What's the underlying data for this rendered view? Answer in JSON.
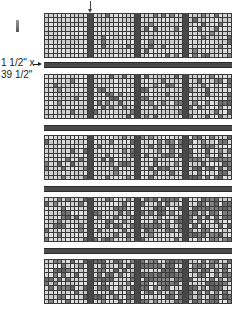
{
  "diagram": {
    "type": "quilt-assembly",
    "dimension_label_line1": "1 1/2\" x",
    "dimension_label_line2": "39 1/2\"",
    "rows": 5,
    "blocks_per_row": 4,
    "grid_size": 10,
    "colors": {
      "sashing": "#474747",
      "grid_line": "#3a3a3a",
      "light_square": "#dcdcdc",
      "dark_square": "#6e6e6e"
    },
    "shading_levels": [
      [
        0.0,
        0.05,
        0.1,
        0.15
      ],
      [
        0.05,
        0.1,
        0.18,
        0.25
      ],
      [
        0.1,
        0.18,
        0.28,
        0.4
      ],
      [
        0.2,
        0.28,
        0.4,
        0.5
      ],
      [
        0.3,
        0.38,
        0.5,
        0.55
      ]
    ]
  }
}
